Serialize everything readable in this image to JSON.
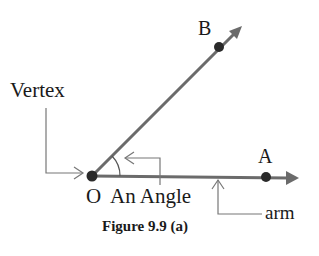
{
  "figure": {
    "caption": "Figure 9.9 (a)",
    "colors": {
      "ray": "#6b6b6b",
      "point": "#2a2a2a",
      "pointer": "#777777",
      "text": "#1a1a1a"
    }
  },
  "points": {
    "vertex": {
      "label": "O",
      "x": 92,
      "y": 176
    },
    "a": {
      "label": "A",
      "x": 266,
      "y": 177
    },
    "b": {
      "label": "B",
      "x": 219,
      "y": 47
    }
  },
  "labels": {
    "vertex": "Vertex",
    "angle": "An Angle",
    "arm": "arm"
  }
}
